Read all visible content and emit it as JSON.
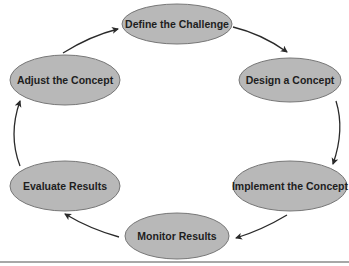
{
  "diagram": {
    "type": "cycle",
    "nodes": [
      {
        "id": "define",
        "label": "Define the Challenge"
      },
      {
        "id": "design",
        "label": "Design a Concept"
      },
      {
        "id": "implement",
        "label": "Implement the Concept"
      },
      {
        "id": "monitor",
        "label": "Monitor Results"
      },
      {
        "id": "evaluate",
        "label": "Evaluate Results"
      },
      {
        "id": "adjust",
        "label": "Adjust the Concept"
      }
    ],
    "edges": [
      {
        "from": "define",
        "to": "design"
      },
      {
        "from": "design",
        "to": "implement"
      },
      {
        "from": "implement",
        "to": "monitor"
      },
      {
        "from": "monitor",
        "to": "evaluate"
      },
      {
        "from": "evaluate",
        "to": "adjust"
      },
      {
        "from": "adjust",
        "to": "define"
      }
    ],
    "colors": {
      "node_fill": "#b8b8b8",
      "node_stroke": "#777777",
      "arrow": "#2a2a2a",
      "text": "#1e1e1e"
    }
  }
}
